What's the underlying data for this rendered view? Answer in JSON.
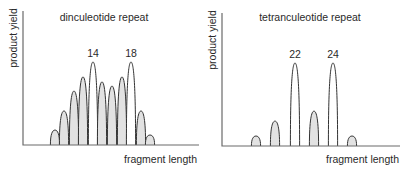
{
  "figure": {
    "panels": [
      {
        "id": "dinucleotide",
        "title": "dinculeotide repeat",
        "ylabel": "product yield",
        "xlabel": "fragment length"
      },
      {
        "id": "tetranucleotide",
        "title": "tetranculeotide repeat",
        "ylabel": "product yield",
        "xlabel": "fragment length"
      }
    ],
    "colors": {
      "axis": "#6a6a6a",
      "outline": "#333333",
      "shaded_fill": "#e2e2e2",
      "unshaded_fill": "#ffffff"
    }
  },
  "chart_data": [
    {
      "type": "bar",
      "title": "dinculeotide repeat",
      "xlabel": "fragment length",
      "ylabel": "product yield",
      "grid": false,
      "note": "Stutter peak profile; relative heights (0-100) estimated. Labeled peaks (alleles) are unshaded.",
      "peaks": [
        {
          "x": 55,
          "height": 18,
          "label": "",
          "shaded": true
        },
        {
          "x": 64,
          "height": 41,
          "label": "",
          "shaded": true
        },
        {
          "x": 74,
          "height": 65,
          "label": "",
          "shaded": true
        },
        {
          "x": 83,
          "height": 82,
          "label": "",
          "shaded": true
        },
        {
          "x": 93,
          "height": 100,
          "label": "14",
          "shaded": false
        },
        {
          "x": 102,
          "height": 76,
          "label": "",
          "shaded": true
        },
        {
          "x": 112,
          "height": 71,
          "label": "",
          "shaded": true
        },
        {
          "x": 122,
          "height": 82,
          "label": "",
          "shaded": true
        },
        {
          "x": 131,
          "height": 100,
          "label": "18",
          "shaded": false
        },
        {
          "x": 141,
          "height": 41,
          "label": "",
          "shaded": true
        },
        {
          "x": 150,
          "height": 12,
          "label": "",
          "shaded": true
        }
      ]
    },
    {
      "type": "bar",
      "title": "tetranculeotide repeat",
      "xlabel": "fragment length",
      "ylabel": "product yield",
      "grid": false,
      "note": "Stutter peak profile; relative heights (0-100) estimated. Labeled peaks (alleles) are unshaded.",
      "peaks": [
        {
          "x": 256,
          "height": 12,
          "label": "",
          "shaded": true
        },
        {
          "x": 275,
          "height": 30,
          "label": "",
          "shaded": true
        },
        {
          "x": 295,
          "height": 100,
          "label": "22",
          "shaded": false
        },
        {
          "x": 314,
          "height": 42,
          "label": "",
          "shaded": true
        },
        {
          "x": 333,
          "height": 100,
          "label": "24",
          "shaded": false
        },
        {
          "x": 352,
          "height": 12,
          "label": "",
          "shaded": true
        }
      ]
    }
  ]
}
